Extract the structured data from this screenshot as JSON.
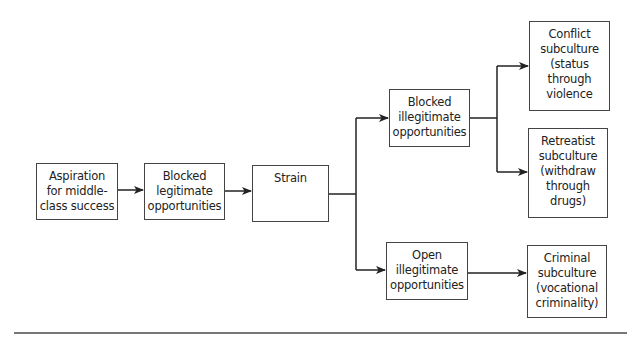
{
  "diagram": {
    "type": "flowchart",
    "nodes": {
      "aspiration": {
        "lines": [
          "Aspiration",
          "for middle-",
          "class success"
        ]
      },
      "blocked_legit": {
        "lines": [
          "Blocked",
          "legitimate",
          "opportunities"
        ]
      },
      "strain": {
        "lines": [
          "Strain"
        ]
      },
      "blocked_illegit": {
        "lines": [
          "Blocked",
          "illegitimate",
          "opportunities"
        ]
      },
      "open_illegit": {
        "lines": [
          "Open",
          "illegitimate",
          "opportunities"
        ]
      },
      "conflict": {
        "lines": [
          "Conflict",
          "subculture",
          "(status",
          "through",
          "violence"
        ]
      },
      "retreatist": {
        "lines": [
          "Retreatist",
          "subculture",
          "(withdraw",
          "through",
          "drugs)"
        ]
      },
      "criminal": {
        "lines": [
          "Criminal",
          "subculture",
          "(vocational",
          "criminality)"
        ]
      }
    },
    "edges": [
      {
        "from": "aspiration",
        "to": "blocked_legit"
      },
      {
        "from": "blocked_legit",
        "to": "strain"
      },
      {
        "from": "strain",
        "to": "blocked_illegit"
      },
      {
        "from": "strain",
        "to": "open_illegit"
      },
      {
        "from": "blocked_illegit",
        "to": "conflict"
      },
      {
        "from": "blocked_illegit",
        "to": "retreatist"
      },
      {
        "from": "open_illegit",
        "to": "criminal"
      }
    ],
    "colors": {
      "line": "#222222",
      "border": "#444444",
      "background": "#ffffff"
    }
  }
}
